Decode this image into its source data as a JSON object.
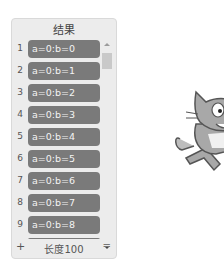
{
  "list_monitor": {
    "title": "结果",
    "items": [
      {
        "index": "1",
        "value": "a=0:b=0"
      },
      {
        "index": "2",
        "value": "a=0:b=1"
      },
      {
        "index": "3",
        "value": "a=0:b=2"
      },
      {
        "index": "4",
        "value": "a=0:b=3"
      },
      {
        "index": "5",
        "value": "a=0:b=4"
      },
      {
        "index": "6",
        "value": "a=0:b=5"
      },
      {
        "index": "7",
        "value": "a=0:b=6"
      },
      {
        "index": "8",
        "value": "a=0:b=7"
      },
      {
        "index": "9",
        "value": "a=0:b=8"
      }
    ],
    "footer": {
      "add_label": "+",
      "length_label": "长度100",
      "resize_label": "="
    }
  },
  "sprite": {
    "name": "cat-sprite"
  }
}
